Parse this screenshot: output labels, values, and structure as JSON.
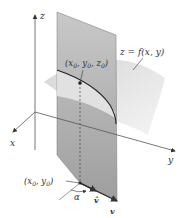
{
  "diagram": {
    "axes": {
      "z_label": "z",
      "x_label": "x",
      "y_label": "y"
    },
    "surface_label": "z = f(x, y)",
    "point_on_surface_label": "(x0, y0, z0)",
    "point_on_surface": {
      "base": "(x",
      "sub1": "0",
      "mid1": ", y",
      "sub2": "0",
      "mid2": ", z",
      "sub3": "0",
      "end": ")"
    },
    "base_point": {
      "base": "(x",
      "sub1": "0",
      "mid1": ", y",
      "sub2": "0",
      "end": ")"
    },
    "angle_label": "α",
    "unit_vector_label": "v̂",
    "vector_label": "v",
    "colors": {
      "plane": "#a8a8a8",
      "plane_top": "#c4c4c4",
      "surface": "#d9d9d9",
      "curve": "#222222",
      "axis": "#444444"
    }
  }
}
